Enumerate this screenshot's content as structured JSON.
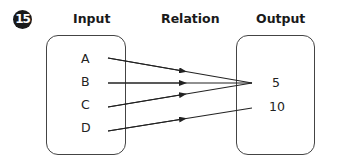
{
  "badge": {
    "number": "15"
  },
  "headers": {
    "input": "Input",
    "relation": "Relation",
    "output": "Output"
  },
  "input": {
    "items": [
      "A",
      "B",
      "C",
      "D"
    ]
  },
  "output": {
    "items": [
      "5",
      "10"
    ]
  },
  "mappings": [
    {
      "from": "A",
      "to": "5"
    },
    {
      "from": "B",
      "to": "5"
    },
    {
      "from": "C",
      "to": "5"
    },
    {
      "from": "D",
      "to": "10"
    }
  ],
  "colors": {
    "line": "#222222",
    "box_border": "#444444",
    "badge_bg": "#1a1a1a"
  }
}
